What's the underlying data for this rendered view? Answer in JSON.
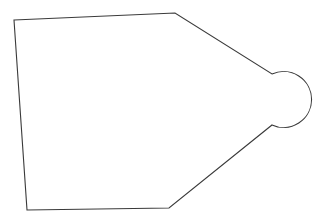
{
  "diagram": {
    "background": "#ffffff",
    "stroke_color": "#3a3a3a",
    "stroke_width": 1.1,
    "shape": {
      "name": "pentagon-with-circular-cap",
      "vertices": {
        "top_left": [
          14,
          20
        ],
        "top_right": [
          175,
          13
        ],
        "upper_joint": [
          272,
          74
        ],
        "lower_joint": [
          272,
          125
        ],
        "bottom_right": [
          169,
          208
        ],
        "bottom_left": [
          27,
          210
        ]
      },
      "cap": {
        "type": "arc",
        "center": [
          284,
          99.5
        ],
        "radius": 28,
        "rightmost": [
          310,
          99
        ]
      }
    }
  }
}
